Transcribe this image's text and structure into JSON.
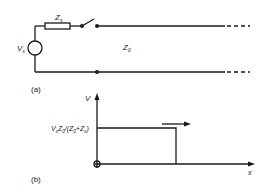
{
  "figure": {
    "part_a": {
      "label": "(a)",
      "source_voltage": {
        "symbol": "V",
        "subscript": "s"
      },
      "source_impedance": {
        "symbol": "Z",
        "subscript": "s"
      },
      "line_impedance": {
        "symbol": "Z",
        "subscript": "0"
      },
      "components": [
        "voltage-source",
        "series-resistor",
        "switch",
        "transmission-line"
      ]
    },
    "part_b": {
      "label": "(b)",
      "y_axis_label": "V",
      "x_axis_label": "x",
      "step_level_label": "VₛZ₀/(Z₀+Zₛ)",
      "step_level_parts": {
        "v": "V",
        "vs": "s",
        "z": "Z",
        "z0": "0",
        "open": "/(Z",
        "z0b": "0",
        "plus": "+Z",
        "zs": "s",
        "close": ")"
      },
      "origin_marker": "circle",
      "wavefront_direction": "right"
    }
  }
}
